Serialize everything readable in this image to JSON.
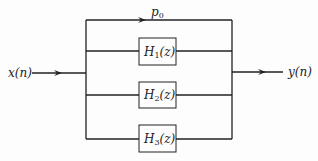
{
  "diagram": {
    "input_label": "x(n)",
    "output_label": "y(n)",
    "gain_label": {
      "base": "p",
      "sub": "0"
    },
    "blocks": [
      {
        "base": "H",
        "sub": "1",
        "arg": "(z)"
      },
      {
        "base": "H",
        "sub": "2",
        "arg": "(z)"
      },
      {
        "base": "H",
        "sub": "3",
        "arg": "(z)"
      }
    ],
    "colors": {
      "line": "#222222",
      "background": "#fdfdfd"
    }
  }
}
